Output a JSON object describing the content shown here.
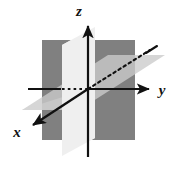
{
  "figure": {
    "background_color": "#ffffff",
    "width": 179,
    "height": 171
  },
  "axes": {
    "x": {
      "label": "x",
      "label_x": 16,
      "label_y": 136,
      "style": "solid-with-arrow",
      "direction": "down-left (toward viewer)",
      "positive_end": [
        30,
        127
      ],
      "negative_end": [
        155,
        47
      ],
      "negative_style": "dotted (hidden behind planes)",
      "color": "#111111"
    },
    "y": {
      "label": "y",
      "label_x": 162,
      "label_y": 95,
      "style": "solid-with-arrow",
      "direction": "right",
      "positive_end": [
        152,
        89
      ],
      "negative_end": [
        28,
        89
      ],
      "negative_style": "solid then dotted near origin",
      "color": "#111111"
    },
    "z": {
      "label": "z",
      "label_x": 79,
      "label_y": 14,
      "style": "solid-with-arrow",
      "direction": "up",
      "positive_end": [
        88,
        22
      ],
      "negative_end": [
        88,
        157
      ],
      "color": "#111111"
    }
  },
  "origin": {
    "x": 88,
    "y": 89
  },
  "planes": [
    {
      "name": "yz-plane",
      "shape": "rectangle",
      "fill": "#808080",
      "points": "42,40 135,40 135,140 42,140",
      "description": "dark gray vertical rectangle facing viewer"
    },
    {
      "name": "xy-plane",
      "shape": "parallelogram",
      "fill": "#d6d6d6",
      "points": "22,110 108,55 165,55 79,110",
      "description": "light gray horizontal plane in perspective"
    },
    {
      "name": "xz-plane",
      "shape": "parallelogram",
      "fill": "#efefef",
      "points": "62,45 95,27 95,138 62,156",
      "description": "near-white vertical plane receding in perspective"
    }
  ],
  "colors": {
    "dark_plane": "#808080",
    "mid_plane": "#d6d6d6",
    "light_plane": "#efefef",
    "axis_line": "#111111",
    "background": "#ffffff"
  }
}
